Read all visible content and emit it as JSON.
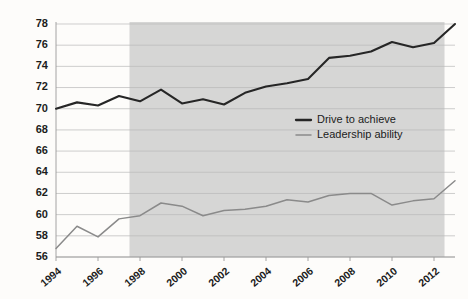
{
  "chart_data": {
    "type": "line",
    "title": "",
    "subtitle": "",
    "xlabel": "",
    "ylabel": "",
    "xlim": [
      1994,
      2013
    ],
    "ylim": [
      56,
      78
    ],
    "grid": true,
    "legend_position": "center-right",
    "x": [
      1994,
      1995,
      1996,
      1997,
      1998,
      1999,
      2000,
      2001,
      2002,
      2003,
      2004,
      2005,
      2006,
      2007,
      2008,
      2009,
      2010,
      2011,
      2012,
      2013
    ],
    "xticks": [
      "1994",
      "1996",
      "1998",
      "2000",
      "2002",
      "2004",
      "2006",
      "2008",
      "2010",
      "2012"
    ],
    "xtick_values": [
      1994,
      1996,
      1998,
      2000,
      2002,
      2004,
      2006,
      2008,
      2010,
      2012
    ],
    "yticks": [
      "56",
      "58",
      "60",
      "62",
      "64",
      "66",
      "68",
      "70",
      "72",
      "74",
      "76",
      "78"
    ],
    "ytick_values": [
      56,
      58,
      60,
      62,
      64,
      66,
      68,
      70,
      72,
      74,
      76,
      78
    ],
    "series": [
      {
        "name": "Drive to achieve",
        "color": "#262626",
        "width": 2.1,
        "values": [
          70.0,
          70.6,
          70.3,
          71.2,
          70.7,
          71.8,
          70.5,
          70.9,
          70.4,
          71.5,
          72.1,
          72.4,
          72.8,
          74.8,
          75.0,
          75.4,
          76.3,
          75.8,
          76.2,
          78.0
        ]
      },
      {
        "name": "Leadership ability",
        "color": "#8a8a8a",
        "width": 1.5,
        "values": [
          56.8,
          58.9,
          57.9,
          59.6,
          59.9,
          61.1,
          60.8,
          59.9,
          60.4,
          60.5,
          60.8,
          61.4,
          61.2,
          61.8,
          62.0,
          62.0,
          60.9,
          61.3,
          61.5,
          63.2
        ]
      }
    ],
    "shaded_band": {
      "label": "",
      "color": "#cdcdcd",
      "x_start": 1997.5,
      "x_end": 2012.5
    }
  },
  "legend": {
    "items": [
      {
        "label": "Drive to achieve",
        "color": "#262626"
      },
      {
        "label": "Leadership ability",
        "color": "#8a8a8a"
      }
    ]
  }
}
